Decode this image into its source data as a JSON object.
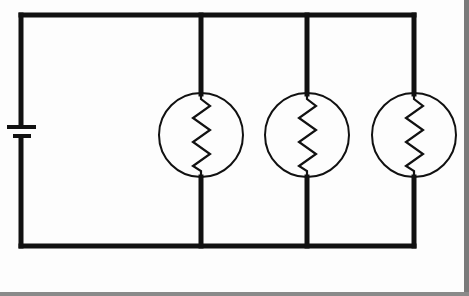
{
  "diagram": {
    "type": "parallel-circuit",
    "description": "Battery connected to three identical light bulbs (resistive filaments) wired in parallel",
    "components": [
      {
        "id": "battery",
        "kind": "battery",
        "label": ""
      },
      {
        "id": "bulb-1",
        "kind": "light-bulb",
        "label": ""
      },
      {
        "id": "bulb-2",
        "kind": "light-bulb",
        "label": ""
      },
      {
        "id": "bulb-3",
        "kind": "light-bulb",
        "label": ""
      }
    ],
    "bulb_count": 3,
    "colors": {
      "wire": "#111111",
      "background": "#fdfdfd",
      "frame": "#7a7a7a"
    }
  }
}
